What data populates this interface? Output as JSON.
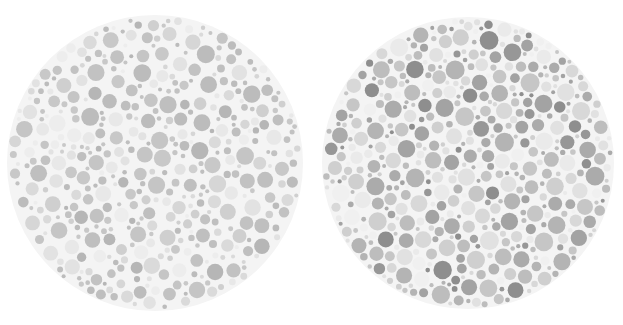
{
  "figure": {
    "type": "ishihara-plate-pair",
    "width": 623,
    "height": 325,
    "background_color": "#ffffff"
  },
  "chart_data": {
    "type": "scatter",
    "title": "",
    "subtitle": "",
    "xlabel": "",
    "ylabel": "",
    "grid": false,
    "legend": "none",
    "xlim": [
      0,
      623
    ],
    "ylim": [
      0,
      325
    ],
    "background_color": "#ffffff",
    "series": [
      {
        "name": "left-plate",
        "plate_index": 1,
        "center_x": 155,
        "center_y": 163,
        "radius": 148,
        "disc_background_color": "#f4f4f4",
        "dot_count": 430,
        "dot_radius_min": 2.0,
        "dot_radius_max": 9.0,
        "contrast": "low",
        "seed": 20147,
        "palette": [
          "#c2c2c2",
          "#bcbcbc",
          "#c8c8c8",
          "#cfcfcf",
          "#b6b6b6",
          "#d6d6d6",
          "#e2e2e2",
          "#ededed",
          "#e8e8e8",
          "#c5c5c5",
          "#bfbfbf",
          "#dadada"
        ],
        "palette_weights": [
          14,
          12,
          13,
          11,
          8,
          10,
          9,
          7,
          6,
          12,
          10,
          9
        ]
      },
      {
        "name": "right-plate",
        "plate_index": 2,
        "center_x": 468,
        "center_y": 163,
        "radius": 146,
        "disc_background_color": "#f4f4f4",
        "dot_count": 470,
        "dot_radius_min": 2.0,
        "dot_radius_max": 9.5,
        "contrast": "high",
        "seed": 73311,
        "palette": [
          "#8e8e8e",
          "#979797",
          "#a3a3a3",
          "#ababab",
          "#b4b4b4",
          "#bdbdbd",
          "#c6c6c6",
          "#cfcfcf",
          "#d8d8d8",
          "#e1e1e1",
          "#eaeaea",
          "#f0f0f0"
        ],
        "palette_weights": [
          6,
          8,
          9,
          10,
          11,
          12,
          12,
          11,
          10,
          9,
          8,
          7
        ]
      }
    ]
  },
  "plates": [
    {
      "id": "plate-left",
      "label": "",
      "aria_label": "Greyscale Ishihara colour-vision test plate, low contrast"
    },
    {
      "id": "plate-right",
      "label": "",
      "aria_label": "Greyscale Ishihara colour-vision test plate, higher contrast"
    }
  ]
}
